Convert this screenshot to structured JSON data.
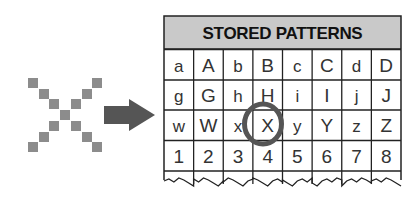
{
  "input_pattern": {
    "name": "X pixel pattern",
    "grid_size": 7,
    "cells": [
      [
        0,
        0
      ],
      [
        1,
        1
      ],
      [
        2,
        2
      ],
      [
        3,
        3
      ],
      [
        4,
        4
      ],
      [
        5,
        5
      ],
      [
        6,
        6
      ],
      [
        0,
        6
      ],
      [
        1,
        5
      ],
      [
        2,
        4
      ],
      [
        4,
        2
      ],
      [
        5,
        1
      ],
      [
        6,
        0
      ]
    ],
    "color": "#8c8c8c"
  },
  "arrow": {
    "color": "#555555"
  },
  "table": {
    "title": "STORED PATTERNS",
    "header_fill": "#c9c9c9",
    "rows": [
      [
        "a",
        "A",
        "b",
        "B",
        "c",
        "C",
        "d",
        "D"
      ],
      [
        "g",
        "G",
        "h",
        "H",
        "i",
        "I",
        "j",
        "J"
      ],
      [
        "w",
        "W",
        "x",
        "X",
        "y",
        "Y",
        "z",
        "Z"
      ],
      [
        "1",
        "2",
        "3",
        "4",
        "5",
        "6",
        "7",
        "8"
      ]
    ],
    "highlight": {
      "row": 2,
      "col": 3,
      "label": "X",
      "color": "#555555"
    }
  }
}
